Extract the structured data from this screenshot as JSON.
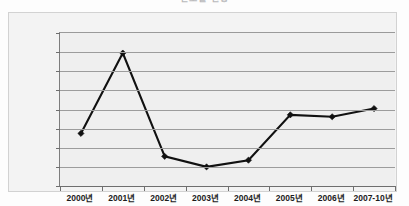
{
  "chart_data": {
    "type": "line",
    "title": "연도별 현황",
    "xlabel": "",
    "ylabel": "",
    "categories": [
      "2000년",
      "2001년",
      "2002년",
      "2003년",
      "2004년",
      "2005년",
      "2006년",
      "2007-10년"
    ],
    "values": [
      2750,
      6950,
      1550,
      1000,
      1350,
      3720,
      3620,
      4050
    ],
    "series": [
      {
        "name": "series-1",
        "values": [
          2750,
          6950,
          1550,
          1000,
          1350,
          3720,
          3620,
          4050
        ]
      }
    ],
    "ylim": [
      0,
      8000
    ],
    "ytick_values": [
      8000,
      7000,
      6000,
      5000,
      4000,
      3000,
      2000,
      1000,
      0
    ],
    "ytick_labels": [
      "8,000",
      "7,000",
      "6,000",
      "5,000",
      "4,000",
      "3,000",
      "2,000",
      "1,000",
      "0"
    ],
    "grid": true,
    "legend": false,
    "legend_position": "none",
    "marker": "diamond",
    "line_color": "#111111",
    "plot_background": "#efefef",
    "gridline_color": "#9c9c9c"
  }
}
